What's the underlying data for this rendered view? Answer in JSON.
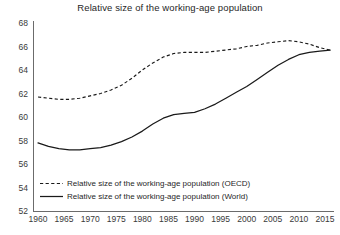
{
  "chart_data": {
    "type": "line",
    "title": "Relative size of the working-age population",
    "xlabel": "",
    "ylabel": "",
    "xlim": [
      1960,
      2016
    ],
    "ylim": [
      52,
      68
    ],
    "ytick_labels": [
      "68",
      "66",
      "64",
      "62",
      "60",
      "58",
      "56",
      "54",
      "52"
    ],
    "yticks": [
      68,
      66,
      64,
      62,
      60,
      58,
      56,
      54,
      52
    ],
    "xtick_labels": [
      "1960",
      "1965",
      "1970",
      "1975",
      "1980",
      "1985",
      "1990",
      "1995",
      "2000",
      "2005",
      "2010",
      "2015"
    ],
    "xticks": [
      1960,
      1965,
      1970,
      1975,
      1980,
      1985,
      1990,
      1995,
      2000,
      2005,
      2010,
      2015
    ],
    "grid": false,
    "legend_position": "lower-left",
    "x": [
      1960,
      1962,
      1964,
      1966,
      1968,
      1970,
      1972,
      1974,
      1976,
      1978,
      1980,
      1982,
      1984,
      1986,
      1988,
      1990,
      1992,
      1994,
      1996,
      1998,
      2000,
      2002,
      2004,
      2006,
      2008,
      2010,
      2012,
      2014,
      2016
    ],
    "series": [
      {
        "name": "Relative size of the working-age population (OECD)",
        "style": "dashed",
        "color": "#1a1a1a",
        "values": [
          61.7,
          61.6,
          61.5,
          61.5,
          61.6,
          61.8,
          62.0,
          62.3,
          62.7,
          63.3,
          64.0,
          64.6,
          65.1,
          65.4,
          65.5,
          65.5,
          65.5,
          65.6,
          65.7,
          65.8,
          66.0,
          66.1,
          66.3,
          66.4,
          66.5,
          66.4,
          66.2,
          65.9,
          65.7
        ]
      },
      {
        "name": "Relative size of the working-age population (World)",
        "style": "solid",
        "color": "#1a1a1a",
        "values": [
          57.8,
          57.5,
          57.3,
          57.2,
          57.2,
          57.3,
          57.4,
          57.6,
          57.9,
          58.3,
          58.8,
          59.4,
          59.9,
          60.2,
          60.3,
          60.4,
          60.7,
          61.1,
          61.6,
          62.1,
          62.6,
          63.2,
          63.8,
          64.4,
          64.9,
          65.3,
          65.5,
          65.6,
          65.7
        ]
      }
    ]
  },
  "legend": {
    "entries": [
      {
        "label": "Relative size of the working-age population (OECD)",
        "style": "dashed"
      },
      {
        "label": "Relative size of the working-age population (World)",
        "style": "solid"
      }
    ]
  },
  "colors": {
    "line": "#1a1a1a",
    "axis": "#6b6b6b",
    "text": "#1f1f1f",
    "background": "#ffffff"
  }
}
